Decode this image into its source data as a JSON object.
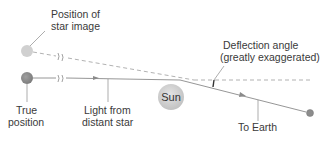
{
  "diagram": {
    "labels": {
      "star_image": [
        "Position of",
        "star image"
      ],
      "true_position": [
        "True",
        "position"
      ],
      "light": [
        "Light from",
        "distant star"
      ],
      "sun": "Sun",
      "deflection": [
        "Deflection angle",
        "(greatly exaggerated)"
      ],
      "earth": "To Earth"
    },
    "colors": {
      "background": "#ffffff",
      "line": "#8a8a8a",
      "dashed_line": "#a8a8a8",
      "star_image": "#cfcfcf",
      "true_star": "#8f8f8f",
      "sun": "#d6d6d6",
      "earth": "#8c8c8c",
      "deflection_mark": "#333333",
      "text": "#3a3a3a"
    }
  }
}
